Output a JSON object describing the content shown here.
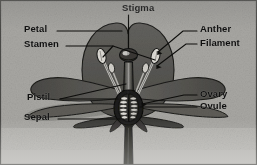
{
  "figure": {
    "background_color": "#a8a7a3",
    "ink_color": "#101010",
    "petal_color": "#5a5955",
    "petal_dark_color": "#4a4945",
    "sepal_color": "#3c3b38",
    "stem_color": "#2a2a28",
    "highlight_color": "#d7d6d1"
  },
  "labels": {
    "stigma": "Stigma",
    "petal": "Petal",
    "stamen": "Stamen",
    "pistil": "Pistil",
    "sepal": "Sepal",
    "anther": "Anther",
    "filament": "Filament",
    "ovary": "Ovary",
    "ovule": "Ovule"
  }
}
